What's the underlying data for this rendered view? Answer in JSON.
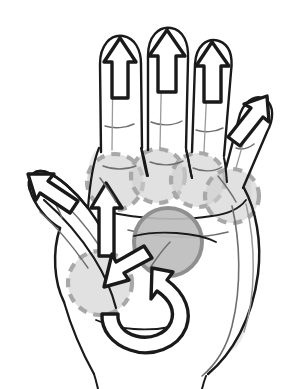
{
  "figure": {
    "background_color": "#ffffff",
    "ink_color": "#1a1a1a",
    "highlight_dashed_fill": "#cfcfcf",
    "highlight_dashed_stroke": "#a8a8a8",
    "highlight_solid_fill": "#bdbdbd",
    "highlight_solid_stroke": "#8f8f8f",
    "shadow_color": "#d5d5d5",
    "canvas": {
      "width": 292,
      "height": 389
    }
  },
  "highlights": [
    {
      "id": "mcp-index",
      "label": "index-mcp-joint-highlight",
      "style": "dashed",
      "cx": 115,
      "cy": 182,
      "r": 28
    },
    {
      "id": "mcp-middle",
      "label": "middle-mcp-joint-highlight",
      "style": "dashed",
      "cx": 158,
      "cy": 176,
      "r": 27
    },
    {
      "id": "mcp-ring",
      "label": "ring-mcp-joint-highlight",
      "style": "dashed",
      "cx": 198,
      "cy": 180,
      "r": 27
    },
    {
      "id": "mcp-little",
      "label": "little-mcp-joint-highlight",
      "style": "dashed",
      "cx": 232,
      "cy": 196,
      "r": 27
    },
    {
      "id": "cmc-thumb",
      "label": "thumb-cmc-joint-highlight",
      "style": "dashed",
      "cx": 100,
      "cy": 283,
      "r": 32
    },
    {
      "id": "carpal",
      "label": "carpal-centre-highlight",
      "style": "solid",
      "cx": 168,
      "cy": 242,
      "r": 34
    }
  ],
  "arrows": [
    {
      "id": "tip-index",
      "label": "index-finger-traction-arrow",
      "direction": "up"
    },
    {
      "id": "tip-middle",
      "label": "middle-finger-traction-arrow",
      "direction": "up"
    },
    {
      "id": "tip-ring",
      "label": "ring-finger-traction-arrow",
      "direction": "up"
    },
    {
      "id": "tip-little",
      "label": "little-finger-traction-arrow",
      "direction": "up-right"
    },
    {
      "id": "tip-thumb",
      "label": "thumb-traction-arrow",
      "direction": "up-left"
    },
    {
      "id": "mcp-push",
      "label": "index-mcp-mobilization-arrow",
      "direction": "up"
    },
    {
      "id": "cmc-push",
      "label": "thumb-cmc-mobilization-arrow",
      "direction": "down-left"
    },
    {
      "id": "wrist-curl",
      "label": "wrist-rotation-curved-arrow",
      "direction": "curved-up-left"
    }
  ]
}
